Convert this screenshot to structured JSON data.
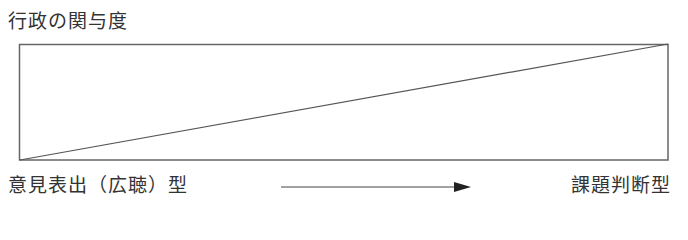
{
  "title": "行政の関与度",
  "axis": {
    "left_label": "意見表出（広聴）型",
    "right_label": "課題判断型",
    "arrow": "arrow-right"
  },
  "colors": {
    "line": "#555555",
    "text": "#333333"
  },
  "box": {
    "x": 19,
    "y": 44,
    "width": 649,
    "height": 116
  }
}
